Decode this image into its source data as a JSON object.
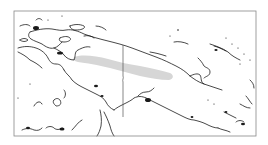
{
  "map": {
    "title": "Range map: New Guinea",
    "region": "New Guinea",
    "frame": {
      "x": 14,
      "y": 11,
      "width": 242,
      "height": 125
    },
    "colors": {
      "background": "#ffffff",
      "frame": "#888888",
      "coastline": "#1a1a1a",
      "border": "#555555",
      "range_fill": "#d6d6d6"
    },
    "layers": [
      {
        "name": "coastline",
        "label": "Coastline"
      },
      {
        "name": "international-border",
        "label": "Indonesia / Papua New Guinea border"
      },
      {
        "name": "species-range",
        "label": "Distribution range (central highlands)"
      }
    ]
  }
}
